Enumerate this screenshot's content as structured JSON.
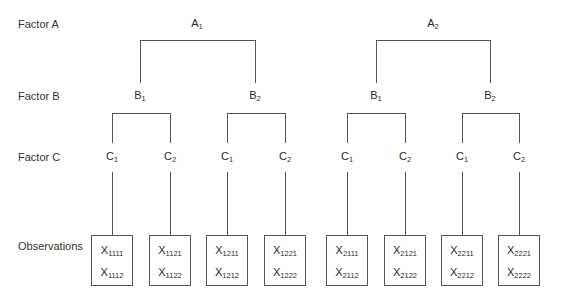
{
  "row_labels": {
    "factor_a": "Factor A",
    "factor_b": "Factor B",
    "factor_c": "Factor C",
    "observations": "Observations"
  },
  "factor_a": [
    {
      "base": "A",
      "sub": "1",
      "x": 197
    },
    {
      "base": "A",
      "sub": "2",
      "x": 433
    }
  ],
  "factor_b": [
    {
      "base": "B",
      "sub": "1",
      "x": 140
    },
    {
      "base": "B",
      "sub": "2",
      "x": 255
    },
    {
      "base": "B",
      "sub": "1",
      "x": 376
    },
    {
      "base": "B",
      "sub": "2",
      "x": 490
    }
  ],
  "factor_c": [
    {
      "base": "C",
      "sub": "1",
      "x": 112
    },
    {
      "base": "C",
      "sub": "2",
      "x": 170
    },
    {
      "base": "C",
      "sub": "1",
      "x": 227
    },
    {
      "base": "C",
      "sub": "2",
      "x": 285
    },
    {
      "base": "C",
      "sub": "1",
      "x": 347
    },
    {
      "base": "C",
      "sub": "2",
      "x": 405
    },
    {
      "base": "C",
      "sub": "1",
      "x": 462
    },
    {
      "base": "C",
      "sub": "2",
      "x": 519
    }
  ],
  "observations": [
    {
      "x": 112,
      "top": {
        "base": "X",
        "sub": "1111"
      },
      "bottom": {
        "base": "X",
        "sub": "1112"
      }
    },
    {
      "x": 170,
      "top": {
        "base": "X",
        "sub": "1121"
      },
      "bottom": {
        "base": "X",
        "sub": "1122"
      }
    },
    {
      "x": 227,
      "top": {
        "base": "X",
        "sub": "1211"
      },
      "bottom": {
        "base": "X",
        "sub": "1212"
      }
    },
    {
      "x": 285,
      "top": {
        "base": "X",
        "sub": "1221"
      },
      "bottom": {
        "base": "X",
        "sub": "1222"
      }
    },
    {
      "x": 347,
      "top": {
        "base": "X",
        "sub": "2111"
      },
      "bottom": {
        "base": "X",
        "sub": "2112"
      }
    },
    {
      "x": 405,
      "top": {
        "base": "X",
        "sub": "2121"
      },
      "bottom": {
        "base": "X",
        "sub": "2122"
      }
    },
    {
      "x": 462,
      "top": {
        "base": "X",
        "sub": "2211"
      },
      "bottom": {
        "base": "X",
        "sub": "2212"
      }
    },
    {
      "x": 519,
      "top": {
        "base": "X",
        "sub": "2221"
      },
      "bottom": {
        "base": "X",
        "sub": "2222"
      }
    }
  ],
  "colors": {
    "line": "#555555",
    "text": "#2a2a2a",
    "background": "#ffffff"
  }
}
